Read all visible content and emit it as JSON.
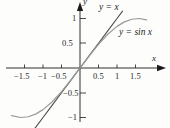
{
  "chart_data": {
    "type": "line",
    "title": "",
    "subtitle": "",
    "xlabel": "x",
    "ylabel": "y",
    "xlim": [
      -1.85,
      1.95
    ],
    "ylim": [
      -1.35,
      1.3
    ],
    "grid": false,
    "legend_position": "inline-annotations",
    "background_color": "#fdfdfc",
    "axis_color": "#1a1a1a",
    "x_ticks": [
      -1.5,
      -1,
      -0.5,
      0.5,
      1,
      1.5
    ],
    "x_tick_labels": [
      "−1.5",
      "−1",
      "−0.5",
      "0.5",
      "1",
      "1.5"
    ],
    "y_ticks": [
      -1,
      -0.5,
      0.5,
      1
    ],
    "y_tick_labels": [
      "−1",
      "−0.5",
      "0.5",
      "1"
    ],
    "series": [
      {
        "name": "y = x",
        "label": "y = x",
        "color": "#4a4a4a",
        "linewidth": 1.1,
        "x": [
          -1.32,
          -1.0,
          -0.75,
          -0.5,
          -0.25,
          0,
          0.25,
          0.5,
          0.75,
          1.0,
          1.15
        ],
        "values": [
          -1.32,
          -1.0,
          -0.75,
          -0.5,
          -0.25,
          0,
          0.25,
          0.5,
          0.75,
          1.0,
          1.15
        ]
      },
      {
        "name": "y = sin x",
        "label": "y = sin x",
        "color": "#9a9a9a",
        "linewidth": 1.2,
        "x": [
          -1.85,
          -1.6,
          -1.4,
          -1.2,
          -1.0,
          -0.75,
          -0.5,
          -0.25,
          0,
          0.25,
          0.5,
          0.75,
          1.0,
          1.2,
          1.4,
          1.6,
          1.8
        ],
        "values": [
          -0.961,
          -1.0,
          -0.985,
          -0.932,
          -0.841,
          -0.682,
          -0.479,
          -0.247,
          0,
          0.247,
          0.479,
          0.682,
          0.841,
          0.932,
          0.985,
          1.0,
          0.974
        ]
      }
    ],
    "annotations": [
      {
        "text": "y = x",
        "x": 0.56,
        "y": 1.22
      },
      {
        "text": "y = sin x",
        "x": 1.12,
        "y": 0.64
      },
      {
        "text": "x",
        "x": 1.9,
        "y": 0.2
      },
      {
        "text": "y",
        "x": 0.12,
        "y": 1.3
      }
    ]
  },
  "axis_labels": {
    "x": "x",
    "y": "y"
  },
  "curve_labels": {
    "line": "y = x",
    "sine": "y = sin x"
  },
  "x_tick_labels": {
    "n15": "−1.5",
    "n10": "−1",
    "n05": "−0.5",
    "p05": "0.5",
    "p10": "1",
    "p15": "1.5"
  },
  "y_tick_labels": {
    "p10": "1",
    "p05": "0.5",
    "n05": "−0.5",
    "n10": "−1"
  }
}
